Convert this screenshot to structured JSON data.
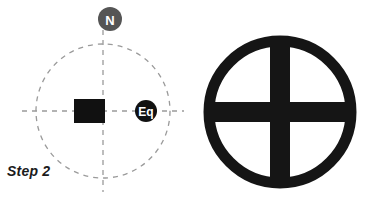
{
  "figure": {
    "caption": "Step 2",
    "background_color": "#ffffff",
    "panels": [
      {
        "name": "earth-cross-section-with-bar-magnet",
        "elements": {
          "orbit_circle": {
            "style": "dashed",
            "color": "#9a9a9a",
            "center_x": 103,
            "center_y": 111,
            "radius": 67
          },
          "vertical_axis": {
            "label": "polar-axis",
            "style": "dashed",
            "color": "#9a9a9a"
          },
          "horizontal_axis": {
            "label": "equatorial-axis",
            "style": "dashed",
            "color": "#9a9a9a"
          },
          "north_marker": {
            "label": "N",
            "fill": "#555555",
            "text_color": "#ffffff",
            "center_x": 110,
            "center_y": 19,
            "radius": 12
          },
          "equator_marker": {
            "label": "Eq",
            "fill": "#111111",
            "text_color": "#ffffff",
            "center_x": 146,
            "center_y": 111,
            "radius": 11
          },
          "bar_magnet": {
            "label": "bar-magnet",
            "fill": "#111111",
            "x": 74,
            "y": 99,
            "width": 31,
            "height": 24
          }
        }
      },
      {
        "name": "crossed-circle-symbol",
        "elements": {
          "outer_circle": {
            "stroke": "#151515",
            "center_x": 90,
            "center_y": 112,
            "radius": 71,
            "stroke_width": 11
          },
          "vertical_bar": {
            "fill": "#151515",
            "width": 20
          },
          "horizontal_bar": {
            "fill": "#151515",
            "height": 20
          }
        }
      }
    ]
  }
}
